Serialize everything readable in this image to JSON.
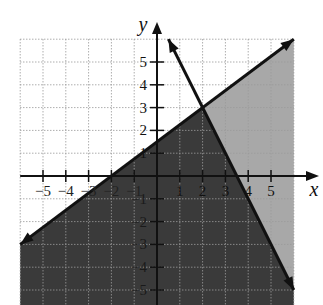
{
  "chart_data": {
    "type": "inequality-graph",
    "title": "",
    "xlabel": "x",
    "ylabel": "y",
    "xlim": [
      -6,
      6
    ],
    "ylim": [
      -5.7,
      6
    ],
    "grid": true,
    "x_ticks": [
      -5,
      -4,
      -3,
      -2,
      -1,
      1,
      2,
      3,
      4,
      5
    ],
    "y_ticks": [
      5,
      4,
      3,
      2,
      1,
      -1,
      -2,
      -3,
      -4,
      -5
    ],
    "x_tick_labels": [
      "−5",
      "−4",
      "−3",
      "−2",
      "−1",
      "1",
      "2",
      "3",
      "4",
      "5"
    ],
    "y_tick_labels": [
      "5",
      "4",
      "3",
      "2",
      "1",
      "−1",
      "−2",
      "−3",
      "−4",
      "−5"
    ],
    "lines": [
      {
        "name": "boundary-1",
        "equation": "y = 0.75x + 1.5",
        "slope": 0.75,
        "intercept": 1.5,
        "style": "solid",
        "endpoints": [
          [
            -6,
            -3
          ],
          [
            6,
            6
          ]
        ]
      },
      {
        "name": "boundary-2",
        "equation": "y = -2x + 7",
        "slope": -2,
        "intercept": 7,
        "style": "solid",
        "endpoints": [
          [
            0.5,
            6
          ],
          [
            6,
            -5
          ]
        ]
      }
    ],
    "intersection": [
      2,
      3
    ],
    "regions": [
      {
        "name": "solution-region",
        "description": "y <= 0.75x + 1.5 and y <= -2x + 7",
        "fill": "#3a3a3a"
      },
      {
        "name": "partial-region",
        "description": "y <= 0.75x + 1.5 and y > -2x + 7",
        "fill": "#a8a8a8"
      }
    ]
  },
  "colors": {
    "dark_fill": "#3a3a3a",
    "light_fill": "#a8a8a8",
    "grid": "#9a9a9a",
    "axis": "#111111",
    "line": "#111111"
  }
}
